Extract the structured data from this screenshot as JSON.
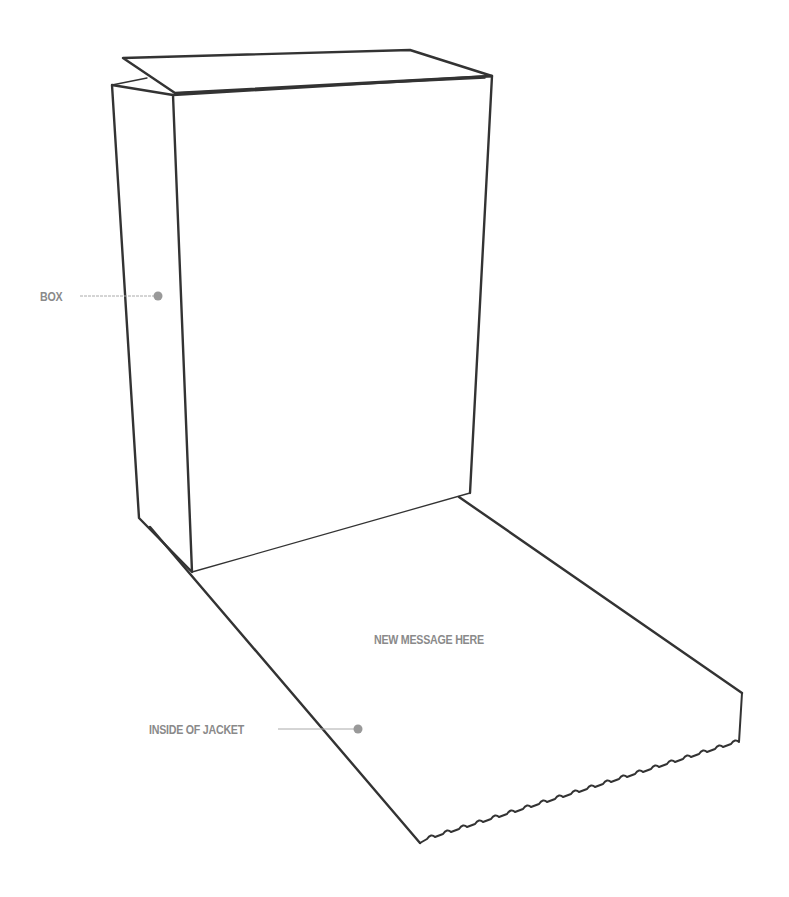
{
  "diagram": {
    "labels": {
      "box": "BOX",
      "inside_jacket": "INSIDE OF JACKET",
      "message": "NEW MESSAGE HERE"
    },
    "colors": {
      "outline": "#333333",
      "label": "#8a8a8a",
      "leader_line": "#aaaaaa",
      "leader_dot": "#999999",
      "background": "#ffffff"
    }
  }
}
